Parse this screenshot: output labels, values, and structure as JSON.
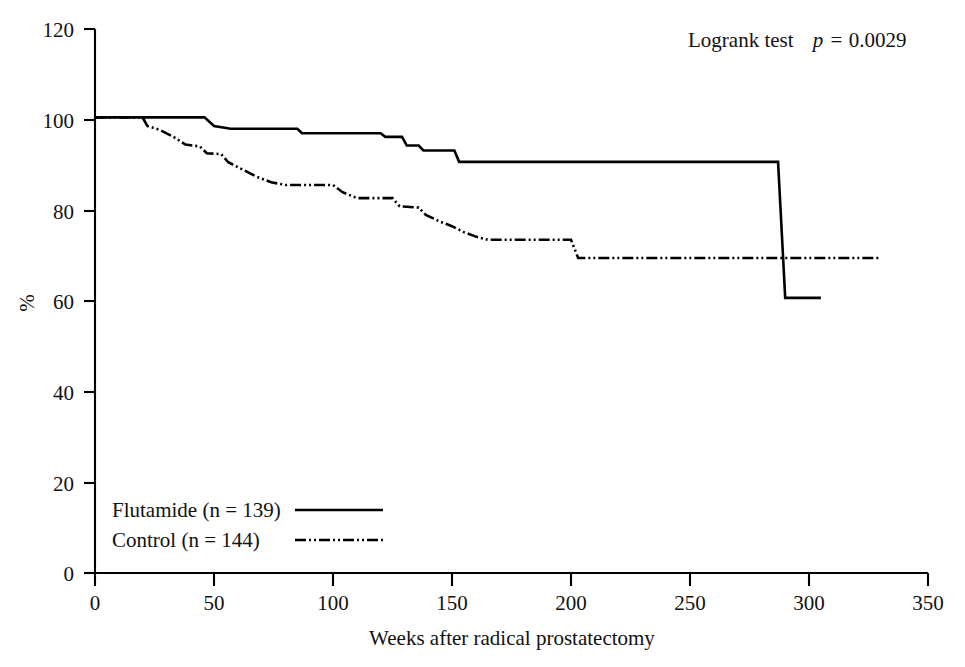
{
  "chart_data": {
    "type": "line",
    "title": "",
    "subtitle": "",
    "xlabel": "Weeks after radical prostatectomy",
    "ylabel": "%",
    "xlim": [
      0,
      350
    ],
    "ylim": [
      0,
      120
    ],
    "xticks": [
      0,
      50,
      100,
      150,
      200,
      250,
      300,
      350
    ],
    "yticks": [
      0,
      20,
      40,
      60,
      80,
      100,
      120
    ],
    "xtick_labels": [
      "0",
      "50",
      "100",
      "150",
      "200",
      "250",
      "300",
      "350"
    ],
    "ytick_labels": [
      "0",
      "20",
      "40",
      "60",
      "80",
      "100",
      "120"
    ],
    "grid": false,
    "legend_position": "lower-left",
    "annotations": [
      {
        "name": "logrank-annotation",
        "prefix": "Logrank test",
        "statistic": "p",
        "relation": "=",
        "value": "0.0029",
        "text": "Logrank test  p = 0.0029"
      }
    ],
    "series": [
      {
        "name": "Flutamide",
        "legend_label": "Flutamide (n = 139)",
        "n": 139,
        "style": "solid",
        "color": "#000000",
        "points": [
          [
            0,
            100.5
          ],
          [
            46,
            100.5
          ],
          [
            50,
            98.6
          ],
          [
            57,
            98.0
          ],
          [
            85,
            98.0
          ],
          [
            87,
            97.0
          ],
          [
            120,
            97.0
          ],
          [
            122,
            96.2
          ],
          [
            129,
            96.2
          ],
          [
            131,
            94.3
          ],
          [
            136,
            94.3
          ],
          [
            138,
            93.2
          ],
          [
            151,
            93.2
          ],
          [
            153,
            90.7
          ],
          [
            287,
            90.7
          ],
          [
            290,
            60.7
          ],
          [
            305,
            60.7
          ]
        ]
      },
      {
        "name": "Control",
        "legend_label": "Control (n = 144)",
        "n": 144,
        "style": "dash-dot-dot",
        "color": "#000000",
        "points": [
          [
            0,
            100.5
          ],
          [
            20,
            100.5
          ],
          [
            22,
            98.6
          ],
          [
            27,
            97.8
          ],
          [
            33,
            96.2
          ],
          [
            38,
            94.5
          ],
          [
            44,
            94.1
          ],
          [
            47,
            92.6
          ],
          [
            53,
            92.4
          ],
          [
            56,
            90.6
          ],
          [
            62,
            89.0
          ],
          [
            68,
            87.4
          ],
          [
            74,
            86.2
          ],
          [
            80,
            85.6
          ],
          [
            100,
            85.6
          ],
          [
            104,
            84.0
          ],
          [
            110,
            82.7
          ],
          [
            125,
            82.7
          ],
          [
            128,
            80.9
          ],
          [
            136,
            80.6
          ],
          [
            139,
            79.0
          ],
          [
            145,
            77.5
          ],
          [
            150,
            76.5
          ],
          [
            155,
            75.2
          ],
          [
            160,
            74.2
          ],
          [
            165,
            73.5
          ],
          [
            200,
            73.5
          ],
          [
            203,
            69.5
          ],
          [
            330,
            69.5
          ]
        ]
      }
    ]
  },
  "legend": {
    "items": [
      {
        "label": "Flutamide (n = 139)",
        "style": "solid"
      },
      {
        "label": "Control (n = 144)",
        "style": "dash-dot-dot"
      }
    ]
  }
}
